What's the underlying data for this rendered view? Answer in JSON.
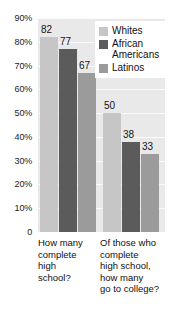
{
  "chart_data": {
    "type": "bar",
    "title": "",
    "subtitle": "",
    "xlabel": "",
    "ylabel": "",
    "ylim": [
      0,
      90
    ],
    "grid": true,
    "legend_position": "top-right",
    "y_ticks": [
      {
        "value": 90,
        "label": "90%"
      },
      {
        "value": 80,
        "label": "80%"
      },
      {
        "value": 70,
        "label": "70%"
      },
      {
        "value": 60,
        "label": "60%"
      },
      {
        "value": 50,
        "label": "50%"
      },
      {
        "value": 40,
        "label": "40%"
      },
      {
        "value": 30,
        "label": "30%"
      },
      {
        "value": 20,
        "label": "20%"
      },
      {
        "value": 10,
        "label": "10%"
      },
      {
        "value": 0,
        "label": "0"
      }
    ],
    "categories": [
      "How many\ncomplete\nhigh\nschool?",
      "Of those who\ncomplete\nhigh school,\nhow many\ngo to college?"
    ],
    "series": [
      {
        "name": "Whites",
        "color": "#c6c6c6",
        "values": [
          82,
          50
        ],
        "labels": [
          "82",
          "50"
        ]
      },
      {
        "name": "African\nAmericans",
        "color": "#5b5b5b",
        "values": [
          77,
          38
        ],
        "labels": [
          "77",
          "38"
        ]
      },
      {
        "name": "Latinos",
        "color": "#9b9b9b",
        "values": [
          67,
          33
        ],
        "labels": [
          "67",
          "33"
        ]
      }
    ]
  },
  "legend": {
    "items": [
      {
        "label": "Whites"
      },
      {
        "label": "African\nAmericans"
      },
      {
        "label": "Latinos"
      }
    ]
  },
  "colors": {
    "plot_background": "#e9e9e9",
    "gridline": "#fbfbfb",
    "page_background": "#ffffff",
    "text": "#111111",
    "whites_bar": "#c6c6c6",
    "african_americans_bar": "#5b5b5b",
    "latinos_bar": "#9b9b9b"
  }
}
